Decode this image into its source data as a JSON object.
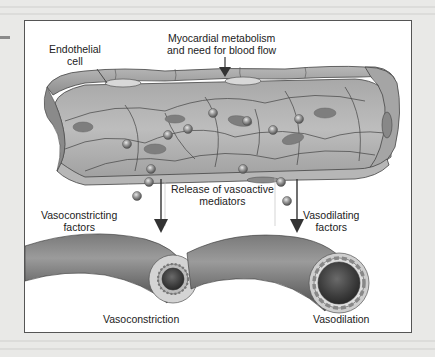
{
  "figure": {
    "labels": {
      "endothelial_cell": [
        "Endothelial",
        "cell"
      ],
      "myocardial": [
        "Myocardial metabolism",
        "and need for blood flow"
      ],
      "release": [
        "Release of vasoactive",
        "mediators"
      ],
      "vasoconstricting": [
        "Vasoconstricting",
        "factors"
      ],
      "vasodilating": [
        "Vasodilating",
        "factors"
      ],
      "vasoconstriction": "Vasoconstriction",
      "vasodilation": "Vasodilation"
    },
    "colors": {
      "vessel_fill": "#9a9a9a",
      "vessel_dark": "#5e5e5e",
      "lumen_light": "#d6d6d6",
      "mediator": "#8c8c8c",
      "frame_border": "#555555",
      "background": "#e9e9e7"
    }
  }
}
